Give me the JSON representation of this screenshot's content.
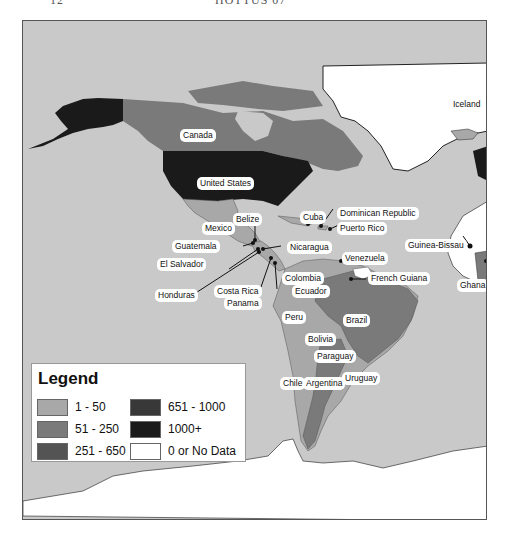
{
  "page": {
    "header_left": "12",
    "header_center": "HOTTUS 07"
  },
  "map": {
    "ocean_color": "#c9c9c9",
    "countries": [
      {
        "name": "Canada",
        "class": "51 - 250"
      },
      {
        "name": "United States",
        "class": "1000+"
      },
      {
        "name": "Mexico",
        "class": "1 - 50"
      },
      {
        "name": "Belize",
        "class": "1 - 50"
      },
      {
        "name": "Cuba",
        "class": "1 - 50"
      },
      {
        "name": "Dominican Republic",
        "class": "1 - 50"
      },
      {
        "name": "Puerto Rico",
        "class": "1 - 50"
      },
      {
        "name": "Guatemala",
        "class": "1 - 50"
      },
      {
        "name": "El Salvador",
        "class": "1 - 50"
      },
      {
        "name": "Nicaragua",
        "class": "1 - 50"
      },
      {
        "name": "Honduras",
        "class": "1 - 50"
      },
      {
        "name": "Costa Rica",
        "class": "1 - 50"
      },
      {
        "name": "Panama",
        "class": "1 - 50"
      },
      {
        "name": "Colombia",
        "class": "1 - 50"
      },
      {
        "name": "Ecuador",
        "class": "1 - 50"
      },
      {
        "name": "Venezuela",
        "class": "1 - 50"
      },
      {
        "name": "French Guiana",
        "class": "1 - 50"
      },
      {
        "name": "Guinea-Bissau",
        "class": "1 - 50"
      },
      {
        "name": "Ghana",
        "class": "1 - 50"
      },
      {
        "name": "Iceland",
        "class": "1 - 50"
      },
      {
        "name": "Peru",
        "class": "1 - 50"
      },
      {
        "name": "Bolivia",
        "class": "1 - 50"
      },
      {
        "name": "Brazil",
        "class": "51 - 250"
      },
      {
        "name": "Paraguay",
        "class": "1 - 50"
      },
      {
        "name": "Chile",
        "class": "1 - 50"
      },
      {
        "name": "Argentina",
        "class": "51 - 250"
      },
      {
        "name": "Uruguay",
        "class": "1 - 50"
      }
    ],
    "labels": {
      "canada": "Canada",
      "united_states": "United States",
      "mexico": "Mexico",
      "belize": "Belize",
      "cuba": "Cuba",
      "dominican_republic": "Dominican Republic",
      "puerto_rico": "Puerto Rico",
      "guatemala": "Guatemala",
      "nicaragua": "Nicaragua",
      "el_salvador": "El Salvador",
      "honduras": "Honduras",
      "costa_rica": "Costa Rica",
      "panama": "Panama",
      "colombia": "Colombia",
      "ecuador": "Ecuador",
      "venezuela": "Venezuela",
      "french_guiana": "French Guiana",
      "guinea_bissau": "Guinea-Bissau",
      "ghana": "Ghana",
      "iceland": "Iceland",
      "peru": "Peru",
      "bolivia": "Bolivia",
      "brazil": "Brazil",
      "paraguay": "Paraguay",
      "chile": "Chile",
      "argentina": "Argentina",
      "uruguay": "Uruguay"
    }
  },
  "legend": {
    "title": "Legend",
    "items": [
      {
        "label": "1 - 50",
        "color": "#a8a8a8"
      },
      {
        "label": "51 - 250",
        "color": "#7a7a7a"
      },
      {
        "label": "251 - 650",
        "color": "#545454"
      },
      {
        "label": "651 - 1000",
        "color": "#383838"
      },
      {
        "label": "1000+",
        "color": "#1a1a1a"
      },
      {
        "label": "0 or No Data",
        "color": "#ffffff"
      }
    ]
  }
}
